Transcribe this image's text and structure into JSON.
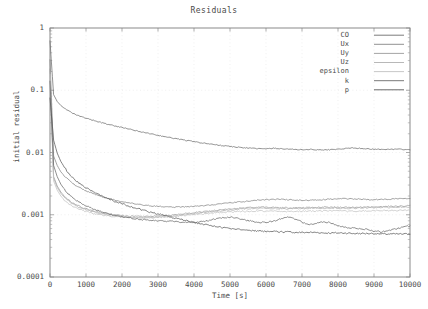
{
  "chart_data": {
    "type": "line",
    "title": "Residuals",
    "xlabel": "Time [s]",
    "ylabel": "initial residual",
    "xlim": [
      0,
      10000
    ],
    "ylim": [
      0.0001,
      1
    ],
    "yscale": "log",
    "grid": true,
    "legend_position": "top-right",
    "xticks": [
      "0",
      "1000",
      "2000",
      "3000",
      "4000",
      "5000",
      "6000",
      "7000",
      "8000",
      "9000",
      "10000"
    ],
    "xtick_values": [
      0,
      1000,
      2000,
      3000,
      4000,
      5000,
      6000,
      7000,
      8000,
      9000,
      10000
    ],
    "yticks": [
      "1",
      "0.1",
      "0.01",
      "0.001",
      "0.0001"
    ],
    "ytick_values": [
      1,
      0.1,
      0.01,
      0.001,
      0.0001
    ],
    "x": [
      0,
      100,
      200,
      300,
      400,
      500,
      600,
      700,
      800,
      900,
      1000,
      1200,
      1400,
      1600,
      1800,
      2000,
      2200,
      2400,
      2600,
      2800,
      3000,
      3200,
      3400,
      3600,
      3800,
      4000,
      4200,
      4400,
      4600,
      4800,
      5000,
      5200,
      5400,
      5600,
      5800,
      6000,
      6200,
      6400,
      6600,
      6800,
      7000,
      7200,
      7400,
      7600,
      7800,
      8000,
      8200,
      8400,
      8600,
      8800,
      9000,
      9200,
      9400,
      9600,
      9800,
      10000
    ],
    "series": [
      {
        "name": "CO",
        "color": "#6d6d6d",
        "values": [
          0.62,
          0.085,
          0.066,
          0.057,
          0.051,
          0.047,
          0.0435,
          0.0408,
          0.0387,
          0.037,
          0.0355,
          0.0328,
          0.0305,
          0.0285,
          0.0268,
          0.0252,
          0.0237,
          0.0223,
          0.0211,
          0.0199,
          0.0189,
          0.0179,
          0.0171,
          0.0163,
          0.0156,
          0.0149,
          0.0143,
          0.0138,
          0.0133,
          0.0129,
          0.0125,
          0.0122,
          0.0119,
          0.0117,
          0.0115,
          0.0114,
          0.0117,
          0.0115,
          0.0113,
          0.0112,
          0.0111,
          0.0112,
          0.0111,
          0.011,
          0.0111,
          0.0113,
          0.0116,
          0.0118,
          0.0117,
          0.0115,
          0.0113,
          0.0112,
          0.0112,
          0.0113,
          0.0112,
          0.0111
        ]
      },
      {
        "name": "Ux",
        "color": "#848484",
        "values": [
          0.31,
          0.0088,
          0.0062,
          0.0049,
          0.0042,
          0.0037,
          0.0033,
          0.003,
          0.00278,
          0.00259,
          0.00243,
          0.00218,
          0.00199,
          0.00184,
          0.00172,
          0.00162,
          0.00154,
          0.00148,
          0.00143,
          0.00139,
          0.00136,
          0.00134,
          0.00133,
          0.00133,
          0.00134,
          0.00136,
          0.00139,
          0.00143,
          0.00147,
          0.00151,
          0.00155,
          0.00159,
          0.00163,
          0.00168,
          0.00172,
          0.00175,
          0.00177,
          0.00177,
          0.00175,
          0.00172,
          0.0017,
          0.0017,
          0.00172,
          0.00175,
          0.00178,
          0.0018,
          0.00181,
          0.0018,
          0.00178,
          0.00176,
          0.00175,
          0.00176,
          0.00178,
          0.00181,
          0.00183,
          0.00185
        ]
      },
      {
        "name": "Uy",
        "color": "#9a9a9a",
        "values": [
          0.22,
          0.0041,
          0.0029,
          0.00232,
          0.00198,
          0.00176,
          0.0016,
          0.00148,
          0.00139,
          0.00131,
          0.00125,
          0.00116,
          0.00109,
          0.00104,
          0.001,
          0.00097,
          0.00095,
          0.00094,
          0.00094,
          0.00094,
          0.00095,
          0.00097,
          0.00099,
          0.00102,
          0.00105,
          0.00108,
          0.00111,
          0.00114,
          0.00117,
          0.0012,
          0.00123,
          0.00126,
          0.00129,
          0.00131,
          0.00132,
          0.00132,
          0.00131,
          0.0013,
          0.00129,
          0.00129,
          0.0013,
          0.00131,
          0.00132,
          0.00133,
          0.00133,
          0.00132,
          0.00131,
          0.00131,
          0.00132,
          0.00133,
          0.00134,
          0.00135,
          0.00136,
          0.00137,
          0.00138,
          0.00139
        ]
      },
      {
        "name": "Uz",
        "color": "#b0b0b0",
        "values": [
          0.2,
          0.0039,
          0.00275,
          0.00221,
          0.00189,
          0.00168,
          0.00153,
          0.00142,
          0.00133,
          0.00126,
          0.0012,
          0.00111,
          0.00105,
          0.001,
          0.00096,
          0.00093,
          0.00091,
          0.0009,
          0.0009,
          0.0009,
          0.00091,
          0.00093,
          0.00095,
          0.00098,
          0.00101,
          0.00104,
          0.00107,
          0.0011,
          0.00113,
          0.00116,
          0.00119,
          0.00122,
          0.00124,
          0.00126,
          0.00127,
          0.00127,
          0.00126,
          0.00125,
          0.00125,
          0.00125,
          0.00126,
          0.00127,
          0.00128,
          0.00128,
          0.00128,
          0.00127,
          0.00127,
          0.00127,
          0.00128,
          0.00129,
          0.0013,
          0.00131,
          0.00131,
          0.00132,
          0.00133,
          0.00134
        ]
      },
      {
        "name": "epsilon",
        "color": "#c2c2c2",
        "values": [
          0.18,
          0.0035,
          0.00248,
          0.002,
          0.00172,
          0.00154,
          0.00141,
          0.00131,
          0.00124,
          0.00118,
          0.00113,
          0.00105,
          0.001,
          0.00096,
          0.00093,
          0.00091,
          0.0009,
          0.00089,
          0.00089,
          0.0009,
          0.00091,
          0.00093,
          0.00095,
          0.00097,
          0.00099,
          0.00101,
          0.00103,
          0.00105,
          0.00107,
          0.00109,
          0.00111,
          0.00112,
          0.00113,
          0.00114,
          0.00115,
          0.00115,
          0.00114,
          0.00114,
          0.00113,
          0.00113,
          0.00114,
          0.00114,
          0.00115,
          0.00115,
          0.00115,
          0.00115,
          0.00114,
          0.00114,
          0.00115,
          0.00115,
          0.00116,
          0.00116,
          0.00117,
          0.00117,
          0.00118,
          0.00118
        ]
      },
      {
        "name": "k",
        "color": "#6a6a6a",
        "values": [
          0.14,
          0.0062,
          0.0041,
          0.0031,
          0.00255,
          0.00219,
          0.00194,
          0.00175,
          0.0016,
          0.00148,
          0.00139,
          0.00124,
          0.00113,
          0.00105,
          0.00098,
          0.00093,
          0.00089,
          0.00086,
          0.00083,
          0.00081,
          0.0008,
          0.00079,
          0.00078,
          0.00077,
          0.00076,
          0.00075,
          0.00077,
          0.00081,
          0.00086,
          0.0009,
          0.00092,
          0.00088,
          0.00083,
          0.00079,
          0.00076,
          0.00075,
          0.00079,
          0.00086,
          0.00091,
          0.00086,
          0.00076,
          0.0007,
          0.00072,
          0.00077,
          0.00074,
          0.00067,
          0.00063,
          0.00061,
          0.0006,
          0.00058,
          0.00055,
          0.00053,
          0.00055,
          0.00059,
          0.00063,
          0.00066
        ]
      },
      {
        "name": "p",
        "color": "#5a5a5a",
        "values": [
          0.075,
          0.0158,
          0.0098,
          0.0072,
          0.0058,
          0.0048,
          0.00415,
          0.00365,
          0.00327,
          0.00296,
          0.00271,
          0.00232,
          0.00204,
          0.00182,
          0.00164,
          0.0015,
          0.00138,
          0.00127,
          0.00118,
          0.0011,
          0.00103,
          0.00096,
          0.0009,
          0.00085,
          0.0008,
          0.00075,
          0.00071,
          0.00068,
          0.00065,
          0.00062,
          0.0006,
          0.00058,
          0.00057,
          0.00056,
          0.00055,
          0.00054,
          0.00054,
          0.00053,
          0.00053,
          0.00052,
          0.00052,
          0.00052,
          0.00052,
          0.00051,
          0.00051,
          0.00051,
          0.00051,
          0.0005,
          0.0005,
          0.0005,
          0.0005,
          0.00049,
          0.00049,
          0.00049,
          0.00049,
          0.00049
        ]
      }
    ]
  },
  "legend": {
    "entries": [
      {
        "label": "CO"
      },
      {
        "label": "Ux"
      },
      {
        "label": "Uy"
      },
      {
        "label": "Uz"
      },
      {
        "label": "epsilon"
      },
      {
        "label": "k"
      },
      {
        "label": "p"
      }
    ]
  }
}
